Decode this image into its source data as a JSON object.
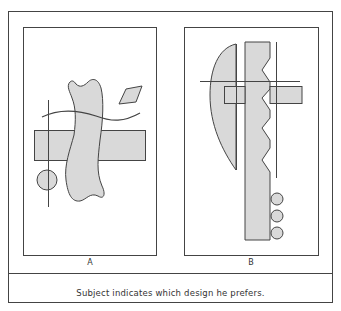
{
  "figure": {
    "panels": [
      {
        "id": "A",
        "label": "A",
        "description": "Irregular abstract design: tall curved blob, horizontal bar, wavy line, diamond, circle and vertical line"
      },
      {
        "id": "B",
        "label": "B",
        "description": "Regular design: tall bar with zigzag edge, cross bar, half-teardrop shape, lines and three small circles"
      }
    ],
    "caption": "Subject indicates which design he prefers.",
    "colors": {
      "fill": "#d9d9d9",
      "stroke": "#444444",
      "background": "#ffffff"
    }
  }
}
